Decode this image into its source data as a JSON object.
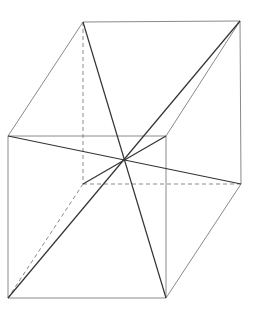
{
  "diagram": {
    "type": "cube-with-space-diagonals",
    "vertices": {
      "back_top_left": [
        83,
        22
      ],
      "back_top_right": [
        240,
        21
      ],
      "front_top_left": [
        8,
        136
      ],
      "front_top_right": [
        166,
        136
      ],
      "back_bottom_left": [
        83,
        184
      ],
      "back_bottom_right": [
        241,
        184
      ],
      "front_bottom_left": [
        8,
        298
      ],
      "front_bottom_right": [
        166,
        298
      ]
    },
    "center": [
      124,
      160
    ],
    "colors": {
      "edge": "#8a8a8a",
      "diagonal": "#333333",
      "background": "#ffffff"
    }
  }
}
